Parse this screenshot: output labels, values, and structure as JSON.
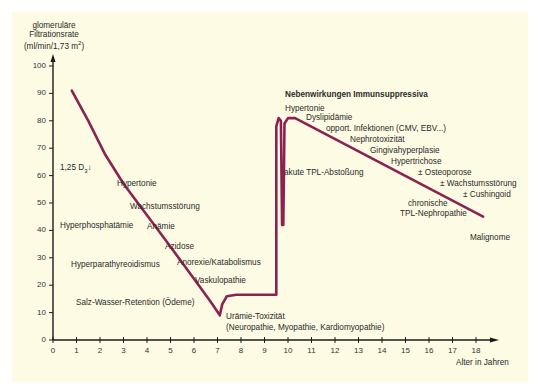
{
  "chart_data": {
    "type": "line",
    "title": "",
    "ylabel": [
      "glomeruläre",
      "Filtrationsrate",
      "(ml/min/1,73 m²)"
    ],
    "xlabel": "Alter in Jahren",
    "xlim": [
      0,
      18
    ],
    "ylim": [
      0,
      100
    ],
    "x_ticks": [
      "0",
      "1",
      "2",
      "3",
      "4",
      "5",
      "6",
      "7",
      "8",
      "9",
      "10",
      "11",
      "12",
      "13",
      "14",
      "15",
      "16",
      "17",
      "18"
    ],
    "y_ticks": [
      "0",
      "10",
      "20",
      "30",
      "40",
      "50",
      "60",
      "70",
      "80",
      "90",
      "100"
    ],
    "grid": false,
    "series": [
      {
        "name": "GFR-Verlauf",
        "color": "#8b2252",
        "points": [
          [
            0.8,
            91
          ],
          [
            1.5,
            80
          ],
          [
            2.2,
            68
          ],
          [
            3.0,
            57
          ],
          [
            3.7,
            49
          ],
          [
            4.4,
            41
          ],
          [
            5.0,
            34
          ],
          [
            5.6,
            27
          ],
          [
            6.2,
            20
          ],
          [
            6.7,
            14
          ],
          [
            7.1,
            9
          ],
          [
            7.2,
            13
          ],
          [
            7.4,
            16
          ],
          [
            7.8,
            16.5
          ],
          [
            9.5,
            16.5
          ],
          [
            9.5,
            78
          ],
          [
            9.6,
            81
          ],
          [
            9.7,
            80
          ],
          [
            9.75,
            42
          ],
          [
            9.8,
            42
          ],
          [
            9.85,
            79
          ],
          [
            10.0,
            81
          ],
          [
            10.3,
            81
          ],
          [
            18.3,
            45
          ]
        ]
      }
    ],
    "annotations": {
      "left": [
        {
          "text": "1,25 D₃↓",
          "x": 0.3,
          "y": 62
        },
        {
          "text": "Hypertonie",
          "x": 2.8,
          "y": 56
        },
        {
          "text": "Wachstumsstörung",
          "x": 3.3,
          "y": 47
        },
        {
          "text": "Hyperphosphatämie",
          "x": 0.3,
          "y": 42
        },
        {
          "text": "Anämie",
          "x": 4.0,
          "y": 41
        },
        {
          "text": "Azidose",
          "x": 4.6,
          "y": 34
        },
        {
          "text": "Hyperparathyreoidismus",
          "x": 0.5,
          "y": 27
        },
        {
          "text": "Anorexie/Katabolismus",
          "x": 5.0,
          "y": 28
        },
        {
          "text": "Vaskulopathie",
          "x": 5.7,
          "y": 21
        },
        {
          "text": "Salz-Wasser-Retention (Ödeme)",
          "x": 0.7,
          "y": 14
        },
        {
          "text": "Urämie-Toxizität",
          "x": 7.3,
          "y": 7
        },
        {
          "text": "(Neuropathie, Myopathie, Kardiomyopathie)",
          "x": 7.3,
          "y": 3
        }
      ],
      "right_title": "Nebenwirkungen Immunsuppressiva",
      "right": [
        {
          "text": "Hypertonie",
          "x": 10.0,
          "y": 84
        },
        {
          "text": "Dyslipidämie",
          "x": 10.9,
          "y": 81
        },
        {
          "text": "opport. Infektionen (CMV, EBV...)",
          "x": 11.5,
          "y": 77
        },
        {
          "text": "Nephrotoxizität",
          "x": 12.6,
          "y": 73
        },
        {
          "text": "Gingivahyperplasie",
          "x": 13.4,
          "y": 69
        },
        {
          "text": "Hypertrichose",
          "x": 14.3,
          "y": 65
        },
        {
          "text": "akute TPL-Abstoßung",
          "x": 10.2,
          "y": 61
        },
        {
          "text": "± Osteoporose",
          "x": 15.3,
          "y": 61
        },
        {
          "text": "± Wachstumsstörung",
          "x": 16.0,
          "y": 57
        },
        {
          "text": "± Cushingoid",
          "x": 16.6,
          "y": 53
        },
        {
          "text": "chronische",
          "x": 15.6,
          "y": 48
        },
        {
          "text": "TPL-Nephropathie",
          "x": 14.8,
          "y": 44
        },
        {
          "text": "Malignome",
          "x": 17.4,
          "y": 35
        }
      ]
    }
  },
  "labels": {
    "ylabel_1": "glomeruläre",
    "ylabel_2": "Filtrationsrate",
    "ylabel_3": "(ml/min/1,73 m",
    "ylabel_sup": "2",
    "ylabel_close": ")",
    "xlabel": "Alter in Jahren",
    "d3": "1,25 D",
    "d3_sub": "3",
    "d3_arrow": "↓",
    "hypertonie_left": "Hypertonie",
    "wachstum_left": "Wachstumsstörung",
    "hyperphos": "Hyperphosphatämie",
    "anaemie": "Anämie",
    "azidose": "Azidose",
    "hyperpara": "Hyperparathyreoidismus",
    "anorexie": "Anorexie/Katabolismus",
    "vaskulo": "Vaskulopathie",
    "salz": "Salz-Wasser-Retention (Ödeme)",
    "uraemie_1": "Urämie-Toxizität",
    "uraemie_2": "(Neuropathie, Myopathie, Kardiomyopathie)",
    "nw_title": "Nebenwirkungen Immunsuppressiva",
    "nw_hypertonie": "Hypertonie",
    "nw_dyslip": "Dyslipidämie",
    "nw_infekt": "opport. Infektionen (CMV, EBV...)",
    "nw_nephro": "Nephrotoxizität",
    "nw_gingiva": "Gingivahyperplasie",
    "nw_hypertrich": "Hypertrichose",
    "akute": "akute TPL-Abstoßung",
    "nw_osteo": "± Osteoporose",
    "nw_wachstum": "± Wachstumsstörung",
    "nw_cushing": "± Cushingoid",
    "chron_1": "chronische",
    "chron_2": "TPL-Nephropathie",
    "malignome": "Malignome"
  },
  "colors": {
    "background": "#fdfbe3",
    "curve": "#8b2252",
    "axis": "#1a1a1a"
  }
}
